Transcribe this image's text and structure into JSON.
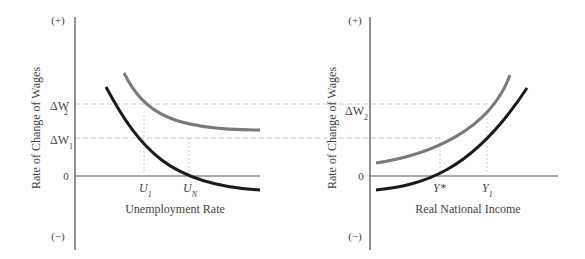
{
  "colors": {
    "axis": "#555555",
    "curve_dark": "#1a1a1a",
    "curve_gray": "#7a7a7a",
    "dashed": "#cccccc",
    "text": "#444444"
  },
  "left_panel": {
    "y_axis_label": "Rate of Change of Wages",
    "x_axis_label": "Unemployment Rate",
    "y_plus": "(+)",
    "y_minus": "(−)",
    "zero_label": "0",
    "y_ticks": [
      {
        "label": "ΔW",
        "sub": "2"
      },
      {
        "label": "ΔW",
        "sub": "1"
      }
    ],
    "x_ticks": [
      {
        "label": "U",
        "sub": "1"
      },
      {
        "label": "U",
        "sub": "N"
      }
    ]
  },
  "right_panel": {
    "y_axis_label": "Rate of Change of Wages",
    "x_axis_label": "Real National Income",
    "y_plus": "(+)",
    "y_minus": "(−)",
    "zero_label": "0",
    "y_ticks": [
      {
        "label": "ΔW",
        "sub": "2"
      }
    ],
    "x_ticks": [
      {
        "label": "Y*",
        "sub": ""
      },
      {
        "label": "Y",
        "sub": "1"
      }
    ]
  }
}
